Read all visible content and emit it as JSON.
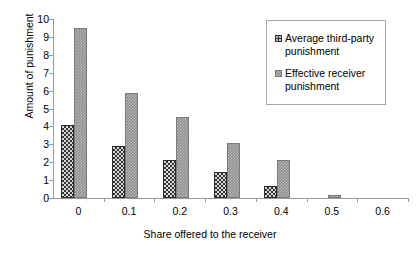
{
  "chart_data": {
    "type": "bar",
    "title": "",
    "xlabel": "Share offered to the receiver",
    "ylabel": "Amount of punishment",
    "categories": [
      "0",
      "0.1",
      "0.2",
      "0.3",
      "0.4",
      "0.5",
      "0.6"
    ],
    "series": [
      {
        "name": "Average third-party punishment",
        "color": "#333333",
        "values": [
          4.1,
          2.9,
          2.1,
          1.45,
          0.65,
          0,
          0
        ]
      },
      {
        "name": "Effective receiver punishment",
        "color": "#8d8d8d",
        "values": [
          9.5,
          5.85,
          4.5,
          3.1,
          2.15,
          0.15,
          0
        ]
      }
    ],
    "ylim": [
      0,
      10
    ],
    "yticks": [
      "0",
      "1",
      "2",
      "3",
      "4",
      "5",
      "6",
      "7",
      "8",
      "9",
      "10"
    ],
    "grid": false,
    "legend_position": "upper right"
  },
  "legend": {
    "entries": [
      {
        "label": "Average third-party punishment"
      },
      {
        "label": "Effective receiver punishment"
      }
    ]
  }
}
